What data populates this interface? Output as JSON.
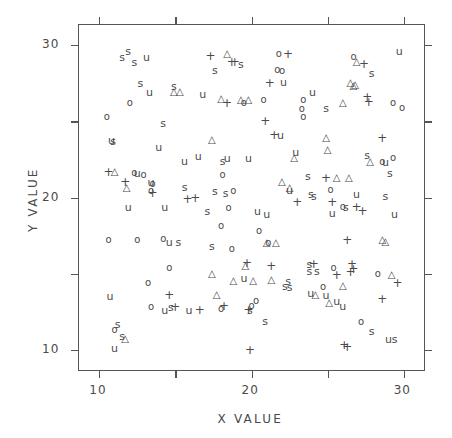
{
  "chart_data": {
    "type": "scatter",
    "title": "",
    "xlabel": "X  VALUE",
    "ylabel": "Y  VALUE",
    "xlim": [
      8.6,
      31.4
    ],
    "ylim": [
      8.6,
      31.4
    ],
    "xticks": [
      10,
      20,
      30
    ],
    "yticks": [
      10,
      20,
      30
    ],
    "xticklabels": [
      "10",
      "20",
      "30"
    ],
    "yticklabels": [
      "10",
      "20",
      "30"
    ],
    "xminorticks": [
      15,
      25
    ],
    "yminorticks": [
      15,
      25
    ],
    "grid": false,
    "legend": null,
    "marker_glyphs": [
      "s",
      "u",
      "+",
      "o",
      "△"
    ],
    "series": [
      {
        "name": "s",
        "glyph": "s",
        "points": [
          [
            11.9,
            29.6
          ],
          [
            11.5,
            29.2
          ],
          [
            12.3,
            28.9
          ],
          [
            19.3,
            28.8
          ],
          [
            17.6,
            28.4
          ],
          [
            27.9,
            28.2
          ],
          [
            12.7,
            27.5
          ],
          [
            14.9,
            27.3
          ],
          [
            24.9,
            25.9
          ],
          [
            14.2,
            24.9
          ],
          [
            10.9,
            23.7
          ],
          [
            27.6,
            22.8
          ],
          [
            18.1,
            22.4
          ],
          [
            29.1,
            21.6
          ],
          [
            23.7,
            21.4
          ],
          [
            15.6,
            20.7
          ],
          [
            17.6,
            20.4
          ],
          [
            18.3,
            20.3
          ],
          [
            23.9,
            20.2
          ],
          [
            28.8,
            20.1
          ],
          [
            24.1,
            20.1
          ],
          [
            26.2,
            19.4
          ],
          [
            17.1,
            19.1
          ],
          [
            15.2,
            17.1
          ],
          [
            17.4,
            16.8
          ],
          [
            23.8,
            15.6
          ],
          [
            23.8,
            15.2
          ],
          [
            24.3,
            15.2
          ],
          [
            22.4,
            14.5
          ],
          [
            22.2,
            14.2
          ],
          [
            22.5,
            14.1
          ],
          [
            14.7,
            12.8
          ],
          [
            20.9,
            11.9
          ],
          [
            11.2,
            11.7
          ],
          [
            11.5,
            10.9
          ],
          [
            29.4,
            10.7
          ],
          [
            27.9,
            11.2
          ],
          [
            19.9,
            12.6
          ]
        ]
      },
      {
        "name": "u",
        "glyph": "u",
        "points": [
          [
            13.1,
            29.2
          ],
          [
            29.7,
            29.6
          ],
          [
            22.1,
            27.6
          ],
          [
            13.3,
            26.9
          ],
          [
            24.0,
            26.9
          ],
          [
            16.8,
            26.8
          ],
          [
            21.9,
            24.1
          ],
          [
            22.9,
            23.0
          ],
          [
            13.9,
            23.3
          ],
          [
            10.8,
            23.8
          ],
          [
            16.5,
            22.7
          ],
          [
            18.4,
            22.6
          ],
          [
            19.8,
            22.6
          ],
          [
            15.6,
            22.4
          ],
          [
            28.8,
            22.3
          ],
          [
            12.5,
            21.6
          ],
          [
            13.4,
            21.0
          ],
          [
            22.5,
            20.5
          ],
          [
            26.9,
            20.2
          ],
          [
            11.9,
            19.4
          ],
          [
            14.3,
            19.4
          ],
          [
            20.4,
            19.1
          ],
          [
            21.0,
            18.9
          ],
          [
            25.3,
            19.0
          ],
          [
            29.4,
            18.9
          ],
          [
            14.6,
            17.1
          ],
          [
            19.5,
            14.7
          ],
          [
            23.9,
            13.7
          ],
          [
            24.9,
            13.6
          ],
          [
            25.6,
            13.2
          ],
          [
            14.3,
            12.6
          ],
          [
            15.9,
            12.6
          ],
          [
            10.7,
            13.5
          ],
          [
            11.0,
            10.1
          ],
          [
            29.0,
            10.7
          ],
          [
            26.0,
            12.9
          ]
        ]
      },
      {
        "name": "+",
        "glyph": "+",
        "points": [
          [
            17.3,
            29.3
          ],
          [
            22.4,
            29.4
          ],
          [
            18.7,
            28.9
          ],
          [
            18.9,
            28.9
          ],
          [
            27.4,
            28.8
          ],
          [
            21.2,
            27.5
          ],
          [
            27.6,
            26.6
          ],
          [
            18.4,
            26.2
          ],
          [
            27.7,
            26.3
          ],
          [
            28.6,
            23.9
          ],
          [
            21.5,
            24.1
          ],
          [
            20.9,
            25.0
          ],
          [
            10.6,
            21.7
          ],
          [
            11.7,
            21.0
          ],
          [
            13.5,
            20.3
          ],
          [
            15.8,
            19.9
          ],
          [
            16.3,
            20.0
          ],
          [
            24.9,
            21.3
          ],
          [
            23.0,
            19.7
          ],
          [
            25.3,
            19.7
          ],
          [
            26.9,
            19.4
          ],
          [
            27.3,
            19.1
          ],
          [
            26.3,
            17.2
          ],
          [
            19.7,
            15.7
          ],
          [
            26.6,
            15.6
          ],
          [
            26.5,
            15.1
          ],
          [
            26.7,
            15.3
          ],
          [
            25.6,
            14.9
          ],
          [
            29.6,
            14.4
          ],
          [
            21.3,
            15.5
          ],
          [
            14.6,
            13.6
          ],
          [
            15.0,
            12.8
          ],
          [
            18.2,
            12.9
          ],
          [
            19.8,
            12.6
          ],
          [
            16.6,
            12.6
          ],
          [
            28.6,
            13.3
          ],
          [
            19.9,
            10.0
          ],
          [
            26.1,
            10.3
          ],
          [
            26.3,
            10.2
          ],
          [
            24.1,
            15.6
          ]
        ]
      },
      {
        "name": "o",
        "glyph": "o",
        "points": [
          [
            21.8,
            29.4
          ],
          [
            21.7,
            28.4
          ],
          [
            22.0,
            28.3
          ],
          [
            26.7,
            29.2
          ],
          [
            12.0,
            26.2
          ],
          [
            19.5,
            26.2
          ],
          [
            20.8,
            26.4
          ],
          [
            23.4,
            26.4
          ],
          [
            23.3,
            25.8
          ],
          [
            23.4,
            25.3
          ],
          [
            10.5,
            25.3
          ],
          [
            29.3,
            26.2
          ],
          [
            29.9,
            25.9
          ],
          [
            29.3,
            22.6
          ],
          [
            12.3,
            21.6
          ],
          [
            12.9,
            21.5
          ],
          [
            13.5,
            20.9
          ],
          [
            13.4,
            20.4
          ],
          [
            18.1,
            21.5
          ],
          [
            18.8,
            20.4
          ],
          [
            18.5,
            19.3
          ],
          [
            25.2,
            20.5
          ],
          [
            28.6,
            22.3
          ],
          [
            26.0,
            19.4
          ],
          [
            18.0,
            18.1
          ],
          [
            20.5,
            17.8
          ],
          [
            10.6,
            17.2
          ],
          [
            12.5,
            17.2
          ],
          [
            14.2,
            17.3
          ],
          [
            18.7,
            16.6
          ],
          [
            21.1,
            17.0
          ],
          [
            14.6,
            15.4
          ],
          [
            13.2,
            14.4
          ],
          [
            25.4,
            15.4
          ],
          [
            13.4,
            12.8
          ],
          [
            18.0,
            12.7
          ],
          [
            20.3,
            13.2
          ],
          [
            20.0,
            12.9
          ],
          [
            27.2,
            11.8
          ],
          [
            11.0,
            11.3
          ],
          [
            28.3,
            15.0
          ],
          [
            24.7,
            14.1
          ]
        ]
      },
      {
        "name": "triangle",
        "glyph": "△",
        "points": [
          [
            18.4,
            29.4
          ],
          [
            26.9,
            28.9
          ],
          [
            26.5,
            27.5
          ],
          [
            26.8,
            27.4
          ],
          [
            26.7,
            27.3
          ],
          [
            26.0,
            26.2
          ],
          [
            14.9,
            26.9
          ],
          [
            15.3,
            26.9
          ],
          [
            18.0,
            26.5
          ],
          [
            19.3,
            26.4
          ],
          [
            19.8,
            26.4
          ],
          [
            17.4,
            23.8
          ],
          [
            11.0,
            21.7
          ],
          [
            11.8,
            20.6
          ],
          [
            22.0,
            21.0
          ],
          [
            25.6,
            21.3
          ],
          [
            26.4,
            21.3
          ],
          [
            27.8,
            22.3
          ],
          [
            22.5,
            20.6
          ],
          [
            22.8,
            22.6
          ],
          [
            24.9,
            23.9
          ],
          [
            25.0,
            23.1
          ],
          [
            21.0,
            17.0
          ],
          [
            21.6,
            17.0
          ],
          [
            28.6,
            17.2
          ],
          [
            28.8,
            17.1
          ],
          [
            17.4,
            15.0
          ],
          [
            18.8,
            14.5
          ],
          [
            20.1,
            14.5
          ],
          [
            21.3,
            14.6
          ],
          [
            26.0,
            14.2
          ],
          [
            29.2,
            14.9
          ],
          [
            17.7,
            13.6
          ],
          [
            24.2,
            13.6
          ],
          [
            25.1,
            13.1
          ],
          [
            11.7,
            10.7
          ],
          [
            19.6,
            15.5
          ]
        ]
      }
    ]
  },
  "axes": {
    "x_title": "X  VALUE",
    "y_title": "Y  VALUE",
    "x_tick_labels": [
      "10",
      "20",
      "30"
    ],
    "y_tick_labels": [
      "10",
      "20",
      "30"
    ]
  }
}
